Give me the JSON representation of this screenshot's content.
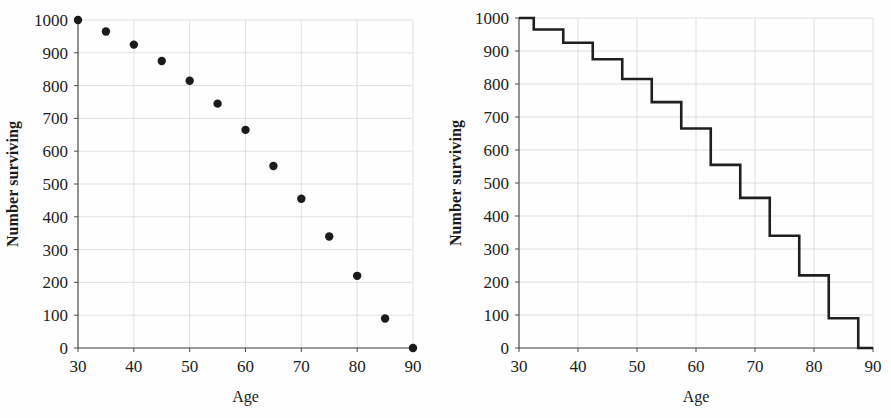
{
  "figure": {
    "background_color": "#fefefe",
    "point_color": "#1b1b1b",
    "curve_color": "#1f1f1f",
    "grid_color": "#d9d9d9",
    "axis_color": "#3b3b3b"
  },
  "panels": [
    {
      "id": "scatter-panel",
      "xlabel": "Age",
      "ylabel": "Number surviving"
    },
    {
      "id": "step-panel",
      "xlabel": "Age",
      "ylabel": "Number surviving"
    }
  ],
  "axis": {
    "x_ticks": [
      "30",
      "40",
      "50",
      "60",
      "70",
      "80",
      "90"
    ],
    "y_ticks": [
      "0",
      "100",
      "200",
      "300",
      "400",
      "500",
      "600",
      "700",
      "800",
      "900",
      "1000"
    ]
  },
  "chart_data": [
    {
      "type": "scatter",
      "title": "",
      "xlabel": "Age",
      "ylabel": "Number surviving",
      "xlim": [
        30,
        90
      ],
      "ylim": [
        0,
        1000
      ],
      "xticks": [
        30,
        40,
        50,
        60,
        70,
        80,
        90
      ],
      "yticks": [
        0,
        100,
        200,
        300,
        400,
        500,
        600,
        700,
        800,
        900,
        1000
      ],
      "grid": true,
      "legend": "none",
      "x": [
        30,
        35,
        40,
        45,
        50,
        55,
        60,
        65,
        70,
        75,
        80,
        85,
        90
      ],
      "values": [
        1000,
        965,
        925,
        875,
        815,
        745,
        665,
        555,
        455,
        340,
        220,
        90,
        0
      ],
      "marker": "filled-circle",
      "marker_color": "#1b1b1b"
    },
    {
      "type": "line",
      "subtype": "step",
      "title": "",
      "xlabel": "Age",
      "ylabel": "Number surviving",
      "xlim": [
        30,
        90
      ],
      "ylim": [
        0,
        1000
      ],
      "xticks": [
        30,
        40,
        50,
        60,
        70,
        80,
        90
      ],
      "yticks": [
        0,
        100,
        200,
        300,
        400,
        500,
        600,
        700,
        800,
        900,
        1000
      ],
      "grid": true,
      "legend": "none",
      "step_where": "mid",
      "x": [
        30,
        35,
        40,
        45,
        50,
        55,
        60,
        65,
        70,
        75,
        80,
        85,
        90
      ],
      "values": [
        1000,
        965,
        925,
        875,
        815,
        745,
        665,
        555,
        455,
        340,
        220,
        90,
        0
      ],
      "line_color": "#1f1f1f"
    }
  ]
}
